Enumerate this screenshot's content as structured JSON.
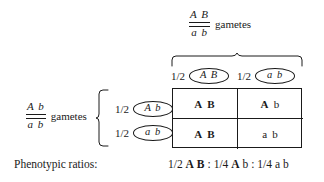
{
  "diagram": {
    "type": "punnett-square"
  },
  "top_parent": {
    "top_alleles": "A B",
    "bottom_alleles": "a b",
    "gametes_word": "gametes"
  },
  "left_parent": {
    "top_alleles": "A b",
    "bottom_alleles": "a b",
    "gametes_word": "gametes"
  },
  "columns": [
    {
      "frequency": "1/2",
      "gamete": "A B"
    },
    {
      "frequency": "1/2",
      "gamete": "a b"
    }
  ],
  "rows": [
    {
      "frequency": "1/2",
      "gamete": "A b"
    },
    {
      "frequency": "1/2",
      "gamete": "a b"
    }
  ],
  "cells": [
    {
      "first": "A",
      "second": "B",
      "first_weight": "bold",
      "second_weight": "bold"
    },
    {
      "first": "A",
      "second": "b",
      "first_weight": "bold",
      "second_weight": "normal"
    },
    {
      "first": "A",
      "second": "B",
      "first_weight": "bold",
      "second_weight": "bold"
    },
    {
      "first": "a",
      "second": "b",
      "first_weight": "normal",
      "second_weight": "normal"
    }
  ],
  "phenotype": {
    "label": "Phenotypic ratios:",
    "ratios": [
      {
        "fraction": "1/2",
        "first": "A",
        "second": "B",
        "first_weight": "bold",
        "second_weight": "bold"
      },
      {
        "fraction": "1/4",
        "first": "A",
        "second": "b",
        "first_weight": "bold",
        "second_weight": "normal"
      },
      {
        "fraction": "1/4",
        "first": "a",
        "second": "b",
        "first_weight": "normal",
        "second_weight": "normal"
      }
    ],
    "separator": ":"
  },
  "colors": {
    "ink": "#1a1a1a",
    "background": "#ffffff"
  }
}
